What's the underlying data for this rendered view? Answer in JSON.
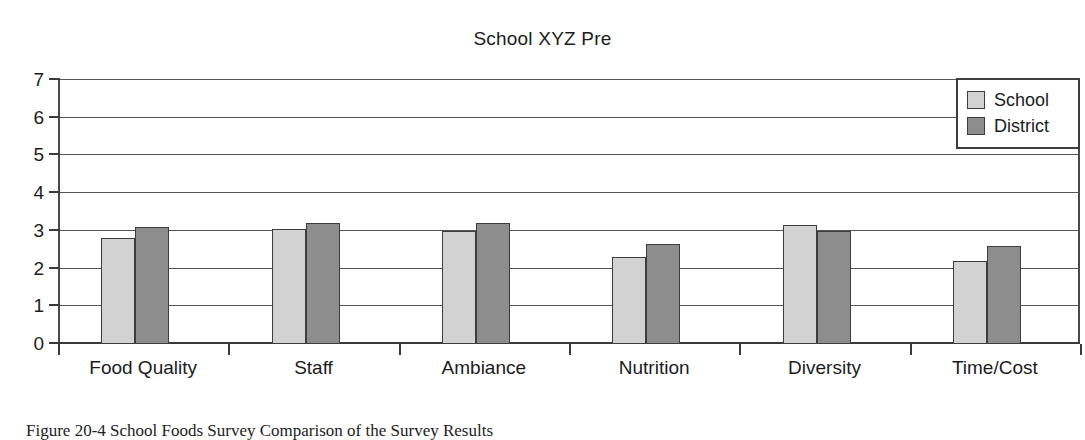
{
  "chart_data": {
    "type": "bar",
    "title": "School XYZ Pre",
    "xlabel": "",
    "ylabel": "",
    "ylim": [
      0,
      7
    ],
    "yticks": [
      0,
      1,
      2,
      3,
      4,
      5,
      6,
      7
    ],
    "grid": true,
    "legend_position": "top-right",
    "categories": [
      "Food Quality",
      "Staff",
      "Ambiance",
      "Nutrition",
      "Diversity",
      "Time/Cost"
    ],
    "series": [
      {
        "name": "School",
        "color": "#d2d2d2",
        "values": [
          2.8,
          3.05,
          3.0,
          2.3,
          3.15,
          2.2
        ]
      },
      {
        "name": "District",
        "color": "#8d8d8d",
        "values": [
          3.1,
          3.2,
          3.2,
          2.65,
          3.0,
          2.6
        ]
      }
    ]
  },
  "legend": {
    "entries": [
      {
        "label": "School"
      },
      {
        "label": "District"
      }
    ]
  },
  "caption": {
    "text": "Figure 20-4 School Foods Survey Comparison of the Survey Results"
  }
}
